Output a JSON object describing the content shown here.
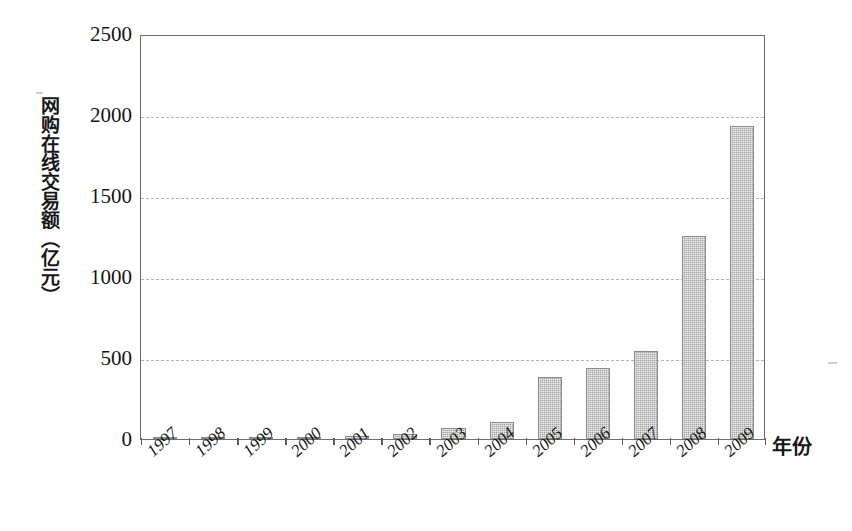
{
  "chart_data": {
    "type": "bar",
    "title": "",
    "xlabel": "年份",
    "ylabel": "网购在线交易额（亿元）",
    "categories": [
      "1997",
      "1998",
      "1999",
      "2000",
      "2001",
      "2002",
      "2003",
      "2004",
      "2005",
      "2006",
      "2007",
      "2008",
      "2009"
    ],
    "values": [
      2,
      4,
      8,
      12,
      20,
      32,
      68,
      105,
      380,
      440,
      545,
      1255,
      1930
    ],
    "ylim": [
      0,
      2500
    ],
    "yticks": [
      0,
      500,
      1000,
      1500,
      2000,
      2500
    ],
    "ytick_labels": [
      "0",
      "500",
      "1000",
      "1500",
      "2000",
      "2500"
    ],
    "grid": true,
    "grid_style": "dashed-horizontal",
    "legend": "none",
    "bar_color": "#a2a2a2",
    "bar_edge_color": "#8b8b8b",
    "axis_color": "#6e6e6e",
    "grid_color": "#b4b4b4",
    "background": "#ffffff",
    "xtick_rotation": -42
  },
  "axes": {
    "y_title": "网购在线交易额（亿元）",
    "x_title": "年份"
  }
}
